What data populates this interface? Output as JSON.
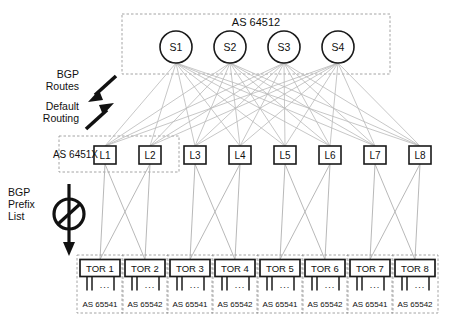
{
  "diagram": {
    "title_spine_as": "AS 64512",
    "leaf_as_label": "AS 6451X",
    "annotations": [
      {
        "id": "bgp-routes",
        "lines": [
          "BGP",
          "Routes"
        ],
        "arrow": "down-left"
      },
      {
        "id": "default-routing",
        "lines": [
          "Default",
          "Routing"
        ],
        "arrow": "up-right"
      },
      {
        "id": "bgp-prefix-list",
        "lines": [
          "BGP",
          "Prefix",
          "List"
        ],
        "arrow": "down-filter"
      }
    ],
    "spines": [
      {
        "label": "S1"
      },
      {
        "label": "S2"
      },
      {
        "label": "S3"
      },
      {
        "label": "S4"
      }
    ],
    "leaves": [
      {
        "label": "L1"
      },
      {
        "label": "L2"
      },
      {
        "label": "L3"
      },
      {
        "label": "L4"
      },
      {
        "label": "L5"
      },
      {
        "label": "L6"
      },
      {
        "label": "L7"
      },
      {
        "label": "L8"
      }
    ],
    "tors": [
      {
        "label": "TOR 1",
        "as": "AS 65541",
        "servers": "..."
      },
      {
        "label": "TOR 2",
        "as": "AS 65542",
        "servers": "..."
      },
      {
        "label": "TOR 3",
        "as": "AS 65541",
        "servers": "..."
      },
      {
        "label": "TOR 4",
        "as": "AS 65542",
        "servers": "..."
      },
      {
        "label": "TOR 5",
        "as": "AS 65541",
        "servers": "..."
      },
      {
        "label": "TOR 6",
        "as": "AS 65542",
        "servers": "..."
      },
      {
        "label": "TOR 7",
        "as": "AS 65541",
        "servers": "..."
      },
      {
        "label": "TOR 8",
        "as": "AS 65542",
        "servers": "..."
      }
    ],
    "colors": {
      "line_mesh": "#b9b9b9",
      "line_tor": "#b0b0b0",
      "node_stroke": "#1a1a1a",
      "dashed_stroke": "#9a9a9a",
      "arrow": "#111111",
      "background": "#ffffff"
    }
  }
}
